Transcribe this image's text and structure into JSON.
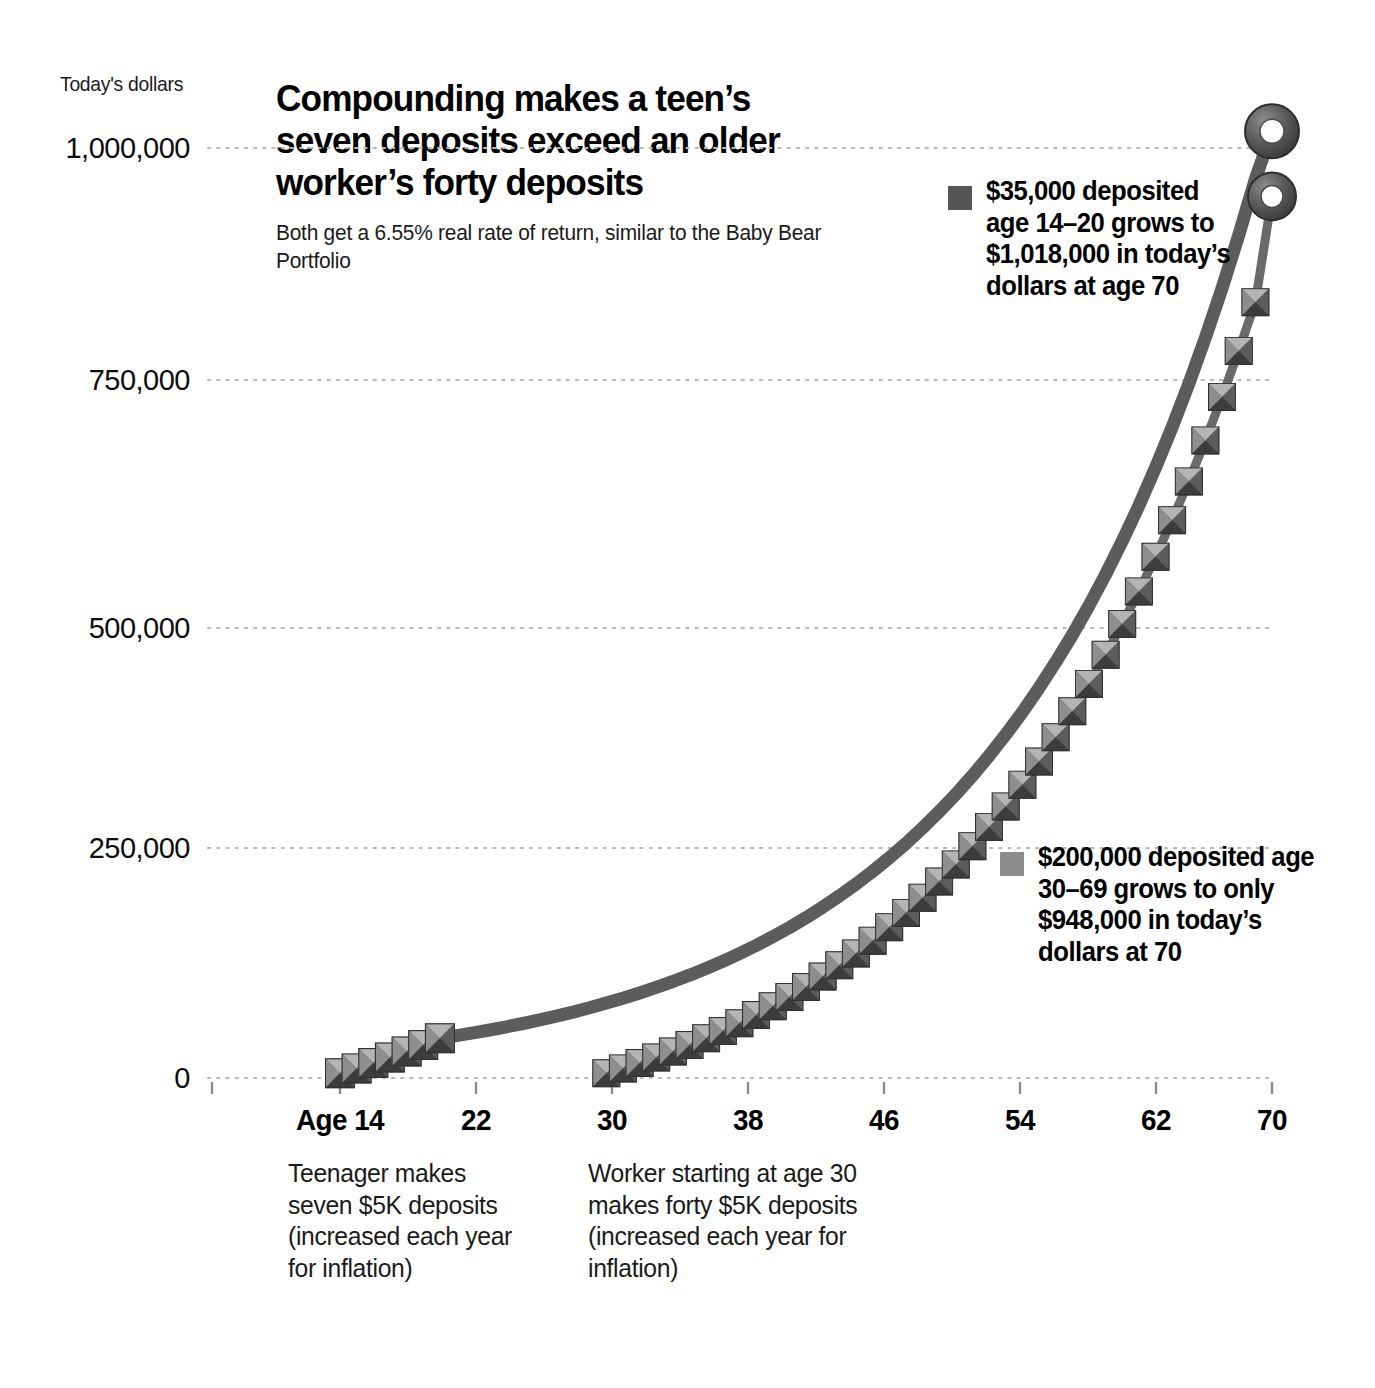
{
  "axis_unit_label": "Today's dollars",
  "title": "Compounding makes a teen’s seven deposits exceed an older worker’s forty deposits",
  "subtitle": "Both get a 6.55% real rate of return, similar to the Baby Bear Portfolio",
  "legend_teen": "$35,000 deposited age 14–20 grows to $1,018,000 in today’s dollars at age 70",
  "legend_worker": "$200,000 deposited age 30–69 grows to only $948,000 in today’s dollars at 70",
  "note_teen": "Teenager makes seven $5K deposits (increased each year for inflation)",
  "note_worker": "Worker starting at age 30 makes forty $5K deposits (increased each year for inflation)",
  "colors": {
    "line": "#5a5a5a",
    "marker_dark": "#4a4a4a",
    "marker_light": "#9a9a9a",
    "gridline": "#b8b8b8",
    "text": "#111111"
  },
  "chart_data": {
    "type": "line",
    "title": "Compounding makes a teen’s seven deposits exceed an older worker’s forty deposits",
    "subtitle": "Both get a 6.55% real rate of return, similar to the Baby Bear Portfolio",
    "xlabel": "Age",
    "ylabel": "Today's dollars",
    "xlim": [
      14,
      70
    ],
    "ylim": [
      0,
      1080000
    ],
    "xticks": [
      14,
      22,
      30,
      38,
      46,
      54,
      62,
      70
    ],
    "xticklabels": [
      "Age 14",
      "22",
      "30",
      "38",
      "46",
      "54",
      "62",
      "70"
    ],
    "yticks": [
      0,
      250000,
      500000,
      750000,
      1000000
    ],
    "yticklabels": [
      "0",
      "250,000",
      "500,000",
      "750,000",
      "1,000,000"
    ],
    "grid": "horizontal-dotted",
    "legend_position": "inside-right",
    "rate_of_return": 0.0655,
    "series": [
      {
        "name": "$35,000 deposited age 14–20",
        "marker": "beveled-square",
        "marker_ages": [
          14,
          15,
          16,
          17,
          18,
          19,
          20
        ],
        "endpoint_marker": "donut-ring",
        "endpoint_value": 1018000,
        "x": [
          14,
          15,
          16,
          17,
          18,
          19,
          20,
          21,
          22,
          23,
          24,
          25,
          26,
          27,
          28,
          29,
          30,
          31,
          32,
          33,
          34,
          35,
          36,
          37,
          38,
          39,
          40,
          41,
          42,
          43,
          44,
          45,
          46,
          47,
          48,
          49,
          50,
          51,
          52,
          53,
          54,
          55,
          56,
          57,
          58,
          59,
          60,
          61,
          62,
          63,
          64,
          65,
          66,
          67,
          68,
          69,
          70
        ],
        "values": [
          5000,
          10328,
          16004,
          22052,
          28496,
          35363,
          42681,
          45477,
          48456,
          51631,
          55014,
          58618,
          62458,
          66549,
          70909,
          75554,
          80503,
          85777,
          91395,
          97383,
          103762,
          110560,
          117802,
          125519,
          133740,
          142499,
          151831,
          161774,
          172366,
          183652,
          195676,
          208487,
          222138,
          236685,
          252188,
          268710,
          286321,
          305093,
          325106,
          346443,
          369195,
          393458,
          419336,
          446942,
          476394,
          507822,
          541364,
          577168,
          615393,
          656211,
          699803,
          746368,
          796115,
          849272,
          906082,
          966806,
          1018000
        ]
      },
      {
        "name": "$200,000 deposited age 30–69",
        "marker": "beveled-square",
        "marker_ages": [
          30,
          31,
          32,
          33,
          34,
          35,
          36,
          37,
          38,
          39,
          40,
          41,
          42,
          43,
          44,
          45,
          46,
          47,
          48,
          49,
          50,
          51,
          52,
          53,
          54,
          55,
          56,
          57,
          58,
          59,
          60,
          61,
          62,
          63,
          64,
          65,
          66,
          67,
          68,
          69
        ],
        "endpoint_marker": "donut-ring",
        "endpoint_value": 948000,
        "x": [
          30,
          31,
          32,
          33,
          34,
          35,
          36,
          37,
          38,
          39,
          40,
          41,
          42,
          43,
          44,
          45,
          46,
          47,
          48,
          49,
          50,
          51,
          52,
          53,
          54,
          55,
          56,
          57,
          58,
          59,
          60,
          61,
          62,
          63,
          64,
          65,
          66,
          67,
          68,
          69,
          70
        ],
        "values": [
          5000,
          10328,
          16004,
          22052,
          28496,
          35363,
          42681,
          50477,
          58782,
          67627,
          77044,
          87068,
          97735,
          109083,
          121153,
          133987,
          147629,
          162127,
          177530,
          193890,
          211261,
          229702,
          249273,
          270039,
          292067,
          315429,
          340202,
          366465,
          394303,
          423806,
          455068,
          488189,
          523275,
          560438,
          599796,
          641475,
          685606,
          732329,
          781790,
          834145,
          948000
        ]
      }
    ]
  }
}
